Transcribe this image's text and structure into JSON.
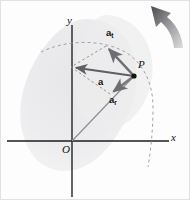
{
  "figure": {
    "caption_present": false,
    "canvas": {
      "width": 190,
      "height": 200
    },
    "background_color": "#fdfdfd"
  },
  "axes": {
    "y_label": "y",
    "x_label": "x",
    "origin_label": "O",
    "color": "#1a1a1a",
    "y_axis": {
      "x": 71,
      "y_top": 24,
      "y_bottom": 196
    },
    "x_axis": {
      "y": 140,
      "x_left": 6,
      "x_right": 168
    }
  },
  "point": {
    "label": "P",
    "x": 133,
    "y": 75,
    "color": "#111111"
  },
  "body_shape": {
    "name": "rigid-body-blob",
    "fill_color": "#ececed",
    "center_x": 90,
    "center_y": 95
  },
  "vectors": [
    {
      "id": "a",
      "label": "a",
      "subscript": "",
      "description": "total acceleration",
      "from_x": 133,
      "from_y": 75,
      "to_x": 70,
      "to_y": 66,
      "color": "#6e6e72",
      "label_x": 99,
      "label_y": 81
    },
    {
      "id": "a_t",
      "label": "a",
      "subscript": "t",
      "description": "tangential acceleration",
      "from_x": 133,
      "from_y": 75,
      "to_x": 105,
      "to_y": 45,
      "color": "#6e6e72",
      "label_x": 107,
      "label_y": 32
    },
    {
      "id": "a_r",
      "label": "a",
      "subscript": "r",
      "description": "radial acceleration",
      "from_x": 133,
      "from_y": 75,
      "to_x": 109,
      "to_y": 93,
      "color": "#7a7a7e",
      "label_x": 110,
      "label_y": 98
    }
  ],
  "position_vector": {
    "name": "origin-to-point-line",
    "from_x": 71,
    "from_y": 140,
    "to_x": 133,
    "to_y": 75,
    "color": "#8d8d91"
  },
  "parallelogram": {
    "name": "dashed-construction-parallelogram",
    "color": "#8a8a8e",
    "dash": "2.5 2.5",
    "points": "133,75 105,45 70,66 109,93"
  },
  "circular_path": {
    "name": "dashed-circular-trajectory",
    "color": "#9a9a9e",
    "dash": "3 3",
    "description": "dashed arc showing circular path of point P"
  },
  "rotation_arrow": {
    "name": "rotation-direction-arrow",
    "direction": "counterclockwise-up-left",
    "color_dark": "#4a4a4e",
    "color_light": "#d2d2d4"
  }
}
